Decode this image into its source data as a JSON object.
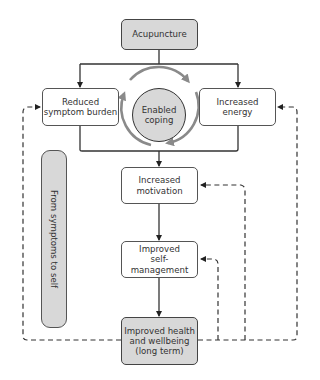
{
  "diagram": {
    "title": "",
    "nodes": {
      "acupuncture": "Acupuncture",
      "reduced_symptom_burden": "Reduced\nsymptom burden",
      "enabled_coping": "Enabled\ncoping",
      "increased_energy": "Increased\nenergy",
      "increased_motivation": "Increased\nmotivation",
      "improved_self_management": "Improved\nself-management",
      "improved_health": "Improved health\nand wellbeing\n(long term)"
    },
    "sidebar_label": "From symptoms to self",
    "edges": [
      {
        "from": "Acupuncture",
        "to": "Reduced symptom burden",
        "style": "solid"
      },
      {
        "from": "Acupuncture",
        "to": "Increased energy",
        "style": "solid"
      },
      {
        "from": "Reduced symptom burden",
        "to": "Increased motivation",
        "style": "solid"
      },
      {
        "from": "Increased energy",
        "to": "Increased motivation",
        "style": "solid"
      },
      {
        "from": "Increased motivation",
        "to": "Improved self-management",
        "style": "solid"
      },
      {
        "from": "Improved self-management",
        "to": "Improved health and wellbeing (long term)",
        "style": "solid"
      },
      {
        "from": "Improved health and wellbeing (long term)",
        "to": "Reduced symptom burden",
        "style": "dashed"
      },
      {
        "from": "Improved health and wellbeing (long term)",
        "to": "Increased energy",
        "style": "dashed"
      },
      {
        "from": "Improved health and wellbeing (long term)",
        "to": "Increased motivation",
        "style": "dashed"
      },
      {
        "from": "Improved health and wellbeing (long term)",
        "to": "Improved self-management",
        "style": "dashed"
      }
    ],
    "colors": {
      "shaded_fill": "#d8d8d8",
      "cycle_arrow": "#8a8a8a",
      "line": "#333333"
    }
  }
}
